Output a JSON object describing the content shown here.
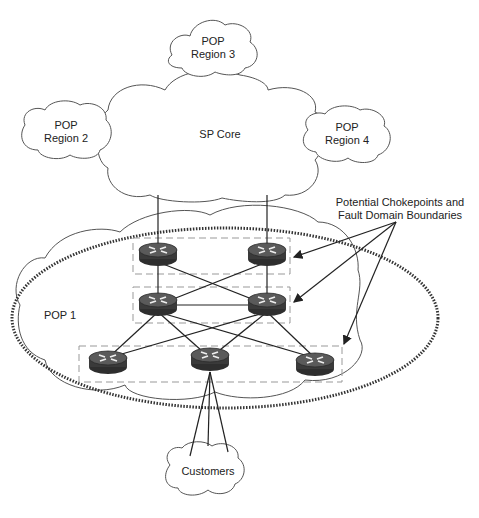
{
  "diagram": {
    "clouds": {
      "pop_region_3": {
        "line1": "POP",
        "line2": "Region 3"
      },
      "pop_region_2": {
        "line1": "POP",
        "line2": "Region 2"
      },
      "pop_region_4": {
        "line1": "POP",
        "line2": "Region 4"
      },
      "sp_core": {
        "label": "SP Core"
      },
      "pop_1": {
        "label": "POP 1"
      },
      "customers": {
        "label": "Customers"
      }
    },
    "annotation": {
      "line1": "Potential Chokepoints and",
      "line2": "Fault Domain Boundaries"
    },
    "routers": [
      {
        "id": "core-left",
        "tier": 1
      },
      {
        "id": "core-right",
        "tier": 1
      },
      {
        "id": "dist-left",
        "tier": 2
      },
      {
        "id": "dist-right",
        "tier": 2
      },
      {
        "id": "access-left",
        "tier": 3
      },
      {
        "id": "access-center",
        "tier": 3
      },
      {
        "id": "access-right",
        "tier": 3
      }
    ],
    "colors": {
      "line": "#222222",
      "cloud_stroke": "#555555",
      "dash_box": "#999999",
      "router_body": "#3a3a3a"
    }
  }
}
